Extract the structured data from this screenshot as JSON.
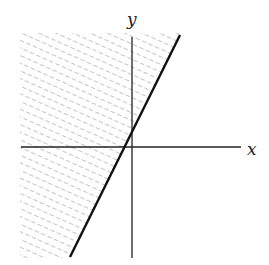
{
  "diagram": {
    "type": "half-plane inequality graph",
    "axes": {
      "x_label": "x",
      "y_label": "y"
    },
    "boundary_line": {
      "style": "solid",
      "slope_sign": "positive",
      "x_intercept": "slightly negative",
      "y_intercept": "slightly positive"
    },
    "shaded_region": "left/above the boundary line",
    "colors": {
      "axes": "#222222",
      "line": "#111111",
      "hatch": "#888888",
      "background": "#ffffff"
    }
  }
}
